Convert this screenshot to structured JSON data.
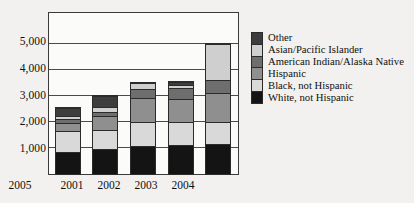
{
  "chart_data": {
    "type": "bar",
    "subtype": "stacked-vertical",
    "title": "",
    "xlabel": "",
    "ylabel": "",
    "categories": [
      "2001",
      "2002",
      "2003",
      "2004",
      "2005"
    ],
    "ylim": [
      0,
      6150
    ],
    "yticks": [
      1000,
      2000,
      3000,
      4000,
      5000
    ],
    "ytick_labels": [
      "1,000",
      "2,000",
      "3,000",
      "4,000",
      "5,000"
    ],
    "grid": "horizontal",
    "legend_position": "right",
    "series": [
      {
        "name": "White, not Hispanic",
        "color": "#141414",
        "values": [
          830,
          960,
          1080,
          1100,
          1160
        ]
      },
      {
        "name": "Black, not Hispanic",
        "color": "#d9d9d9",
        "values": [
          820,
          720,
          930,
          900,
          840
        ]
      },
      {
        "name": "Hispanic",
        "color": "#8f8f8f",
        "values": [
          330,
          560,
          920,
          880,
          1110
        ]
      },
      {
        "name": "American Indian/Alaska Native",
        "color": "#6e6e6e",
        "values": [
          140,
          160,
          340,
          410,
          520
        ]
      },
      {
        "name": "Asian/Pacific Islander",
        "color": "#cfcfcf",
        "values": [
          100,
          170,
          230,
          150,
          1370
        ]
      },
      {
        "name": "Other",
        "color": "#3d3d3d",
        "values": [
          330,
          430,
          0,
          110,
          0
        ]
      }
    ],
    "totals": [
      2550,
      3000,
      3500,
      3550,
      5000
    ]
  },
  "legend": {
    "items": [
      {
        "label": "Other",
        "color": "#3d3d3d"
      },
      {
        "label": "Asian/Pacific Islander",
        "color": "#cfcfcf"
      },
      {
        "label": "American Indian/Alaska Native",
        "color": "#6e6e6e"
      },
      {
        "label": "Hispanic",
        "color": "#8f8f8f"
      },
      {
        "label": "Black, not Hispanic",
        "color": "#d9d9d9"
      },
      {
        "label": "White, not Hispanic",
        "color": "#141414"
      }
    ]
  },
  "style": {
    "background": "#f2f1ef",
    "plot_background": "#fbfbfa",
    "frame_color": "#3a3a3a",
    "gridline_color": "#4a4a4a"
  }
}
